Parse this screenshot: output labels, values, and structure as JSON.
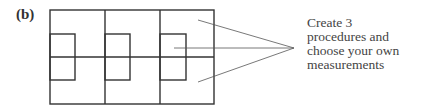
{
  "figure": {
    "label": "(b)",
    "annotation_lines": [
      "Create 3",
      "procedures and",
      "choose your own",
      "measurements"
    ]
  },
  "diagram": {
    "outer_rect": {
      "x": 50,
      "y": 10,
      "w": 164,
      "h": 94
    },
    "dividers_x": [
      105,
      160
    ],
    "midline_y": 57,
    "inner_squares": [
      {
        "x": 50,
        "y": 34,
        "w": 25,
        "h": 46
      },
      {
        "x": 105,
        "y": 34,
        "w": 25,
        "h": 46
      },
      {
        "x": 160,
        "y": 34,
        "w": 26,
        "h": 46
      }
    ],
    "pointer_lines": [
      {
        "x1": 198,
        "y1": 20,
        "x2": 294,
        "y2": 48
      },
      {
        "x1": 174,
        "y1": 48,
        "x2": 294,
        "y2": 48
      },
      {
        "x1": 198,
        "y1": 82,
        "x2": 294,
        "y2": 48
      }
    ],
    "stroke_color": "#333333",
    "pointer_color": "#555555"
  }
}
